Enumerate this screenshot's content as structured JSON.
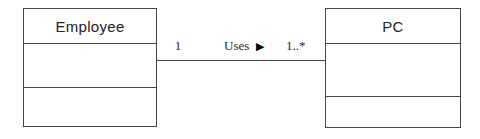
{
  "diagram": {
    "type": "uml-class-diagram",
    "classes": [
      {
        "name": "Employee",
        "attributes": "",
        "operations": ""
      },
      {
        "name": "PC",
        "attributes": "",
        "operations": ""
      }
    ],
    "association": {
      "name": "Uses",
      "direction_icon": "▶",
      "from_multiplicity": "1",
      "to_multiplicity": "1..*"
    },
    "colors": {
      "line": "#454545",
      "text": "#1e1e1e",
      "background": "#ffffff"
    }
  }
}
